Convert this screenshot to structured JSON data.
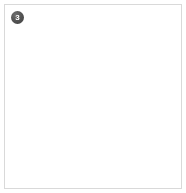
{
  "panel": {
    "badge_number": "3",
    "badge_name": "panel-index-badge",
    "background_color": "#ffffff",
    "border_color": "#d9d9d9",
    "badge_fill_color": "#555555",
    "badge_text_color": "#ffffff"
  },
  "image": {
    "subject": "dark-sphere",
    "description": "Large near-black matte sphere photographed against a plain white background",
    "sphere": {
      "shape": "circle",
      "diameter_px": 152,
      "center_x_px": 94,
      "center_y_px": 96,
      "base_color": "#050505",
      "shadow_color": "#020202",
      "highlight_color": "#6b6b6b",
      "rim_light_color": "#787878",
      "highlight_position": "upper-center-right",
      "rim_light_position": "lower-left"
    },
    "background_color": "#ffffff"
  }
}
